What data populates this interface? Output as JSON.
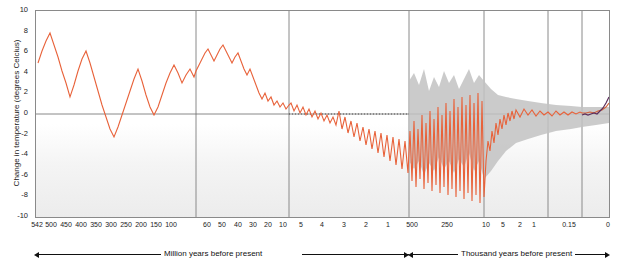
{
  "chart_data": {
    "type": "line",
    "title": "",
    "ylabel": "Change in temperature (degrees Celcius)",
    "xlabel_left": "Million years before present",
    "xlabel_right": "Thousand years before present",
    "ylim": [
      -10,
      10
    ],
    "yticks": [
      "10",
      "8",
      "6",
      "4",
      "2",
      "0",
      "-2",
      "-4",
      "-6",
      "-8",
      "-10"
    ],
    "xticks_left_label": [
      "542",
      "500",
      "450",
      "400",
      "350",
      "300",
      "250",
      "200",
      "150",
      "100",
      "60",
      "50",
      "40",
      "30",
      "20",
      "10",
      "5",
      "4",
      "3",
      "2",
      "1"
    ],
    "xticks_right_label": [
      "500",
      "250",
      "100",
      "50",
      "20",
      "10",
      "5",
      "2",
      "1",
      "0.15",
      "0"
    ],
    "grid": "vertical panel separators only",
    "legend": "none",
    "series": [
      {
        "name": "Paleozoic-Mesozoic reconstruction",
        "color": "#e8623a",
        "note": "542-100 Ma, oscillating between about -3 and +7 degrees",
        "values": [
          4.8,
          6.2,
          7.0,
          5.5,
          3.5,
          2.0,
          4.0,
          5.8,
          4.3,
          2.2,
          1.0,
          2.8,
          4.6,
          3.0,
          1.2,
          -0.5,
          -2.0,
          -1.0,
          0.8,
          2.5,
          4.0,
          2.8,
          1.4,
          3.2,
          4.5,
          3.3,
          2.2,
          3.8,
          5.0,
          4.2,
          3.0
        ]
      },
      {
        "name": "Cenozoic reconstruction",
        "color": "#e8623a",
        "note": "65-0 Ma, declining from about +6 to near 0 degrees with high-frequency glacial cycles to -8"
      },
      {
        "name": "Ice core record (uncertainty band)",
        "color": "#b5b5b5",
        "note": "grey shaded uncertainty envelope in the thousand-year panels"
      },
      {
        "name": "Recent / instrumental",
        "color": "#6b3a6b",
        "note": "dark purple line in the most recent 0.15 thousand years rising to about +1"
      }
    ],
    "panels": [
      {
        "id": "p1",
        "range": "542-100 million years",
        "ticks": [
          "542",
          "500",
          "450",
          "400",
          "350",
          "300",
          "250",
          "200",
          "150",
          "100"
        ]
      },
      {
        "id": "p2",
        "range": "100-10 million years",
        "ticks": [
          "60",
          "50",
          "40",
          "30",
          "20",
          "10"
        ]
      },
      {
        "id": "p3",
        "range": "10-1 million years",
        "ticks": [
          "5",
          "4",
          "3",
          "2",
          "1"
        ]
      },
      {
        "id": "p4",
        "range": "500-10 thousand years",
        "ticks": [
          "500",
          "250"
        ]
      },
      {
        "id": "p5",
        "range": "10-1 thousand years",
        "ticks": [
          "10",
          "5",
          "2",
          "1"
        ]
      },
      {
        "id": "p6",
        "range": "1-0 thousand years",
        "ticks": [
          "0.15",
          "0"
        ]
      }
    ]
  }
}
